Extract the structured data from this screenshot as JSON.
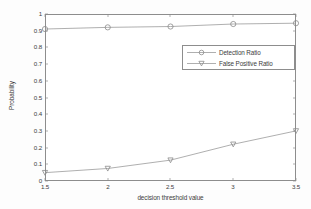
{
  "chart_data": {
    "type": "line",
    "title": "",
    "xlabel": "decision threshold value",
    "ylabel": "Probability",
    "xlim": [
      1.5,
      3.5
    ],
    "ylim": [
      0,
      1
    ],
    "grid": false,
    "legend_position": "upper right inside",
    "x": [
      1.5,
      2,
      2.5,
      3,
      3.5
    ],
    "xticks": [
      "1.5",
      "2",
      "2.5",
      "3",
      "3.5"
    ],
    "yticks": [
      "0",
      "0.1",
      "0.2",
      "0.3",
      "0.4",
      "0.5",
      "0.6",
      "0.7",
      "0.8",
      "0.9",
      "1"
    ],
    "series": [
      {
        "name": "Detection Ratio",
        "marker": "circle",
        "color": "#9a9a9a",
        "values": [
          0.91,
          0.92,
          0.925,
          0.94,
          0.945
        ]
      },
      {
        "name": "False Positive Ratio",
        "marker": "triangle-down",
        "color": "#9a9a9a",
        "values": [
          0.05,
          0.075,
          0.125,
          0.22,
          0.3
        ]
      }
    ]
  },
  "axes": {
    "xlabel": "decision threshold value",
    "ylabel": "Probability",
    "xticks": [
      {
        "label": "1.5",
        "px": 45
      },
      {
        "label": "2",
        "px": 108
      },
      {
        "label": "2.5",
        "px": 170
      },
      {
        "label": "3",
        "px": 233
      },
      {
        "label": "3.5",
        "px": 296
      }
    ],
    "yticks": [
      {
        "label": "1",
        "px": 14
      },
      {
        "label": "0.9",
        "px": 31
      },
      {
        "label": "0.8",
        "px": 47
      },
      {
        "label": "0.7",
        "px": 64
      },
      {
        "label": "0.6",
        "px": 81
      },
      {
        "label": "0.5",
        "px": 98
      },
      {
        "label": "0.4",
        "px": 114
      },
      {
        "label": "0.3",
        "px": 131
      },
      {
        "label": "0.2",
        "px": 148
      },
      {
        "label": "0.1",
        "px": 164
      },
      {
        "label": "0",
        "px": 181
      }
    ]
  },
  "legend": {
    "entries": [
      {
        "label": "Detection Ratio",
        "marker": "circle"
      },
      {
        "label": "False Positive Ratio",
        "marker": "triangle-down"
      }
    ]
  },
  "colors": {
    "axis": "#8d8d8d",
    "line": "#9a9a9a",
    "text": "#3c3c3c",
    "background": "#fdfdfd"
  }
}
